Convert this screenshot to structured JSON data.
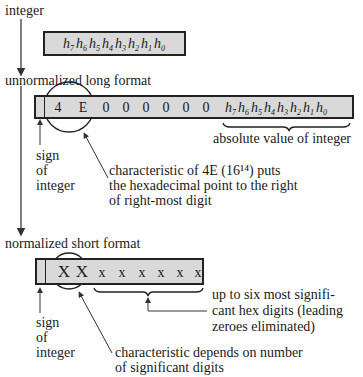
{
  "labels": {
    "integer": "integer",
    "unnormalized": "unnormalized long format",
    "normalized": "normalized short format",
    "abs_value": "absolute value of integer",
    "sign1": [
      "sign",
      "of",
      "integer"
    ],
    "sign2": [
      "sign",
      "of",
      "integer"
    ],
    "char_long": [
      "characteristic of 4E (16¹⁴) puts",
      "the hexadecimal point to the right",
      "of right-most digit"
    ],
    "six_digits": [
      "up to six most signifi-",
      "cant hex digits (leading",
      "zeroes eliminated)"
    ],
    "char_short": [
      "characteristic depends on number",
      "of significant digits"
    ]
  },
  "integer_box": {
    "digits": [
      "h",
      "h",
      "h",
      "h",
      "h",
      "h",
      "h",
      "h"
    ],
    "subs": [
      "7",
      "6",
      "5",
      "4",
      "3",
      "2",
      "1",
      "0"
    ]
  },
  "long_box": {
    "characteristic": [
      "4",
      "E"
    ],
    "zeros": [
      "0",
      "0",
      "0",
      "0",
      "0",
      "0"
    ],
    "digits": [
      "h",
      "h",
      "h",
      "h",
      "h",
      "h",
      "h",
      "h"
    ],
    "subs": [
      "7",
      "6",
      "5",
      "4",
      "3",
      "2",
      "1",
      "0"
    ]
  },
  "short_box": {
    "characteristic": [
      "X",
      "X"
    ],
    "fraction": [
      "x",
      "x",
      "x",
      "x",
      "x",
      "x"
    ]
  },
  "colors": {
    "box_fill": "#d9d9d9",
    "ink": "#1a1a1a"
  }
}
